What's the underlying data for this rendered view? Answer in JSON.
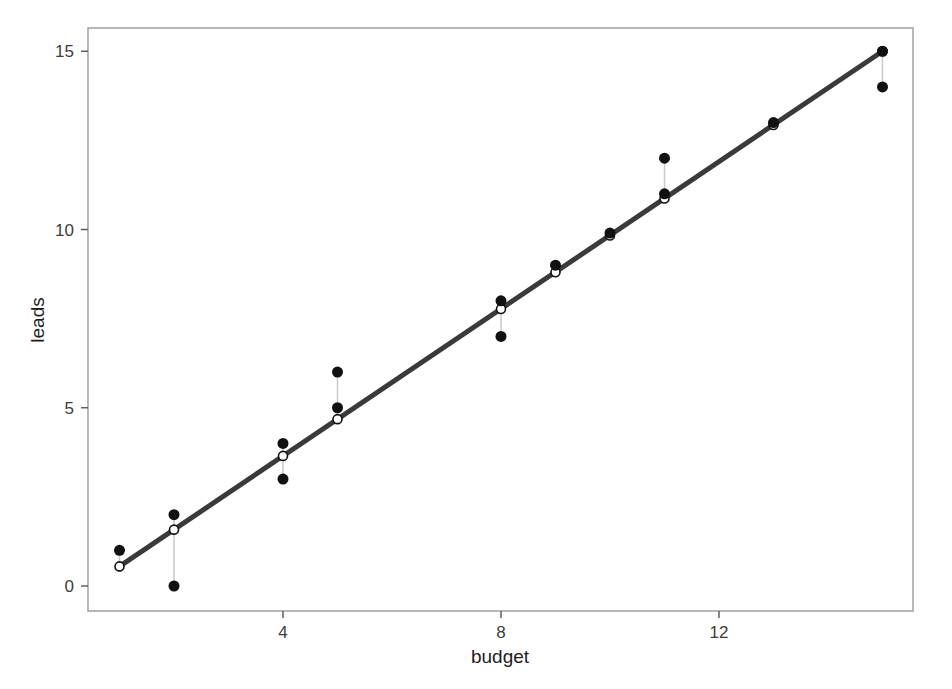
{
  "chart_data": {
    "type": "scatter",
    "title": "",
    "subtitle": "",
    "xlabel": "budget",
    "ylabel": "leads",
    "xlim": [
      0.45,
      15.55
    ],
    "ylim": [
      -0.45,
      15.75
    ],
    "xticks": [
      4,
      8,
      12
    ],
    "xtick_labels": [
      "4",
      "8",
      "12"
    ],
    "yticks": [
      0,
      5,
      10,
      15
    ],
    "ytick_labels": [
      "0",
      "5",
      "10",
      "15"
    ],
    "grid": false,
    "legend": "none",
    "frame": true,
    "series": [
      {
        "name": "observed",
        "marker": "filled-circle",
        "color": "#111111",
        "x": [
          1,
          2,
          2,
          4,
          4,
          5,
          5,
          8,
          8,
          9,
          10,
          11,
          11,
          13,
          15,
          15
        ],
        "y": [
          1,
          2,
          0,
          4,
          3,
          6,
          5,
          8,
          7,
          9,
          9.9,
          12,
          11,
          13,
          15,
          14
        ]
      },
      {
        "name": "fitted",
        "marker": "open-circle",
        "color": "#111111",
        "x": [
          1,
          2,
          4,
          5,
          8,
          9,
          10,
          11,
          13,
          15
        ],
        "y": [
          0.55,
          1.58,
          3.65,
          4.68,
          7.77,
          8.8,
          9.83,
          10.87,
          12.93,
          15.0
        ]
      }
    ],
    "regression_line": {
      "name": "least-squares-fit",
      "color": "#3a3a3a",
      "width": 5,
      "x_start": 1,
      "y_start": 0.55,
      "x_end": 15,
      "y_end": 15.0,
      "slope": 1.0321,
      "intercept": -0.4821
    },
    "residual_segments": {
      "name": "residuals",
      "color": "#c8c8c8",
      "width": 1.5,
      "pairs": [
        {
          "x": 1,
          "y_obs": 1,
          "y_fit": 0.55
        },
        {
          "x": 2,
          "y_obs": 2,
          "y_fit": 1.58
        },
        {
          "x": 2,
          "y_obs": 0,
          "y_fit": 1.58
        },
        {
          "x": 4,
          "y_obs": 4,
          "y_fit": 3.65
        },
        {
          "x": 4,
          "y_obs": 3,
          "y_fit": 3.65
        },
        {
          "x": 5,
          "y_obs": 6,
          "y_fit": 4.68
        },
        {
          "x": 5,
          "y_obs": 5,
          "y_fit": 4.68
        },
        {
          "x": 8,
          "y_obs": 8,
          "y_fit": 7.77
        },
        {
          "x": 8,
          "y_obs": 7,
          "y_fit": 7.77
        },
        {
          "x": 9,
          "y_obs": 9,
          "y_fit": 8.8
        },
        {
          "x": 10,
          "y_obs": 9.9,
          "y_fit": 9.83
        },
        {
          "x": 11,
          "y_obs": 12,
          "y_fit": 10.87
        },
        {
          "x": 11,
          "y_obs": 11,
          "y_fit": 10.87
        },
        {
          "x": 13,
          "y_obs": 13,
          "y_fit": 12.93
        },
        {
          "x": 15,
          "y_obs": 15,
          "y_fit": 15.0
        },
        {
          "x": 15,
          "y_obs": 14,
          "y_fit": 15.0
        }
      ]
    },
    "colors": {
      "frame": "#9a9a9a",
      "tick": "#555555",
      "tick_label": "#3d3d3d",
      "axis_title": "#1d1d1d",
      "point": "#111111",
      "line": "#3a3a3a",
      "residual": "#c8c8c8",
      "background": "#ffffff"
    },
    "geometry": {
      "frame_left": 88,
      "frame_right": 913,
      "frame_top": 28,
      "frame_bottom": 611,
      "x_unit_px": 54.5,
      "x_at_zero_px": 65.0,
      "y_unit_px": 35.65,
      "y_at_zero_px": 586.0,
      "point_radius": 5.5,
      "open_radius": 4.5
    }
  }
}
